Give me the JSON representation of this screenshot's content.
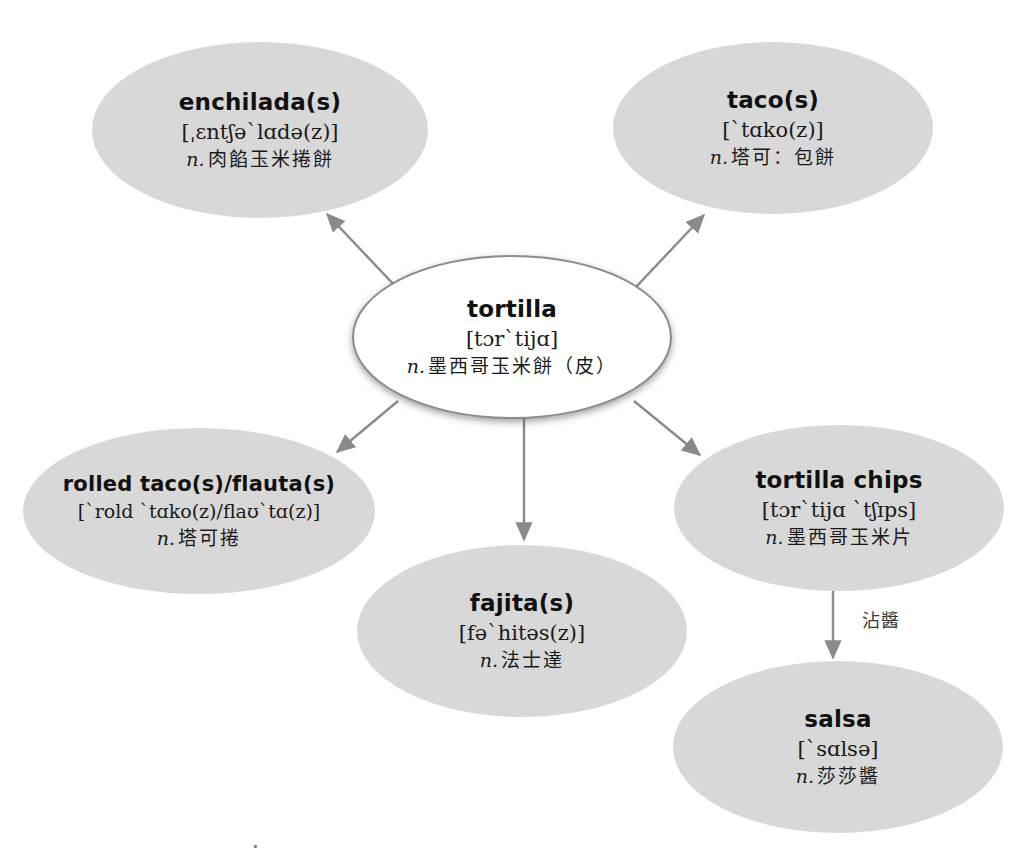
{
  "diagram": {
    "background_color": "#ffffff",
    "node_fill": "#d8d8d8",
    "center_fill": "#ffffff",
    "arrow_color": "#8a8a8a"
  },
  "center": {
    "term": "tortilla",
    "ipa": "[tɔrˋtijɑ]",
    "pos": "n.",
    "gloss": "墨西哥玉米餅（皮）"
  },
  "nodes": [
    {
      "id": "enchilada",
      "term": "enchilada(s)",
      "ipa": "[ˌɛntʃəˋlɑdə(z)]",
      "pos": "n.",
      "gloss": "肉餡玉米捲餅"
    },
    {
      "id": "taco",
      "term": "taco(s)",
      "ipa": "[ˋtɑko(z)]",
      "pos": "n.",
      "gloss": "塔可：包餅"
    },
    {
      "id": "rolled-taco",
      "term": "rolled taco(s)/flauta(s)",
      "ipa": "[ˋrold ˋtɑko(z)/flaʊˋtɑ(z)]",
      "pos": "n.",
      "gloss": "塔可捲"
    },
    {
      "id": "tortilla-chips",
      "term": "tortilla chips",
      "ipa": "[tɔrˋtijɑ ˋtʃɪps]",
      "pos": "n.",
      "gloss": "墨西哥玉米片"
    },
    {
      "id": "fajita",
      "term": "fajita(s)",
      "ipa": "[fəˋhitəs(z)]",
      "pos": "n.",
      "gloss": "法士達"
    },
    {
      "id": "salsa",
      "term": "salsa",
      "ipa": "[ˋsɑlsə]",
      "pos": "n.",
      "gloss": "莎莎醬"
    }
  ],
  "edges": [
    {
      "id": "to-enchilada",
      "from": "tortilla",
      "to": "enchilada",
      "label": ""
    },
    {
      "id": "to-taco",
      "from": "tortilla",
      "to": "taco",
      "label": ""
    },
    {
      "id": "to-rolled-taco",
      "from": "tortilla",
      "to": "rolled-taco",
      "label": ""
    },
    {
      "id": "to-fajita",
      "from": "tortilla",
      "to": "fajita",
      "label": ""
    },
    {
      "id": "to-tortilla-chips",
      "from": "tortilla",
      "to": "tortilla-chips",
      "label": ""
    },
    {
      "id": "to-salsa",
      "from": "tortilla-chips",
      "to": "salsa",
      "label": "沾醬"
    }
  ]
}
